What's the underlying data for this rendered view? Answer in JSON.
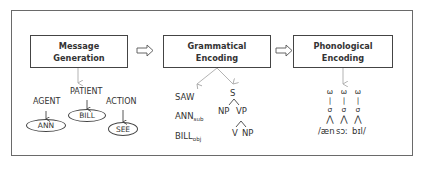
{
  "diagram": {
    "stages": [
      {
        "id": "message-generation",
        "line1": "Message",
        "line2": "Generation"
      },
      {
        "id": "grammatical-encoding",
        "line1": "Grammatical",
        "line2": "Encoding"
      },
      {
        "id": "phonological-encoding",
        "line1": "Phonological",
        "line2": "Encoding"
      }
    ],
    "message": {
      "roles": [
        {
          "role": "AGENT",
          "value": "ANN"
        },
        {
          "role": "PATIENT",
          "value": "BILL"
        },
        {
          "role": "ACTION",
          "value": "SEE"
        }
      ]
    },
    "grammatical": {
      "lemmas": [
        {
          "word": "SAW",
          "sub": ""
        },
        {
          "word": "ANN",
          "sub": "sub"
        },
        {
          "word": "BILL",
          "sub": "obj"
        }
      ],
      "tree": {
        "root": "S",
        "level1_left": "NP",
        "level1_right": "VP",
        "level2_left": "V",
        "level2_right": "NP"
      }
    },
    "phonological": {
      "omega": "ω",
      "sigma": "σ",
      "bar": "|",
      "branch": "⋀",
      "segments": [
        "/æn",
        "sɔː",
        "bɪl/"
      ]
    }
  }
}
